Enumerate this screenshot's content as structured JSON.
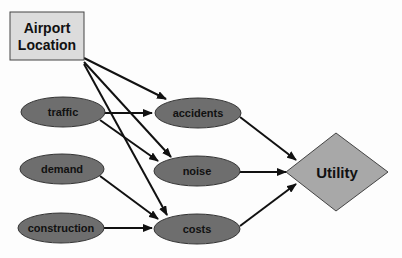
{
  "diagram": {
    "title_node": {
      "label_line1": "Airport",
      "label_line2": "Location"
    },
    "chance_nodes": {
      "traffic": "traffic",
      "demand": "demand",
      "construction": "construction",
      "accidents": "accidents",
      "noise": "noise",
      "costs": "costs"
    },
    "utility_node": {
      "label": "Utility"
    },
    "edges": [
      [
        "Airport Location",
        "accidents"
      ],
      [
        "Airport Location",
        "noise"
      ],
      [
        "Airport Location",
        "costs"
      ],
      [
        "traffic",
        "accidents"
      ],
      [
        "traffic",
        "noise"
      ],
      [
        "demand",
        "costs"
      ],
      [
        "construction",
        "costs"
      ],
      [
        "accidents",
        "Utility"
      ],
      [
        "noise",
        "Utility"
      ],
      [
        "costs",
        "Utility"
      ]
    ],
    "colors": {
      "decision_fill": "#dcdcdc",
      "chance_fill": "#6e6e6e",
      "utility_fill": "#a8a8a8",
      "edge": "#111111"
    }
  }
}
